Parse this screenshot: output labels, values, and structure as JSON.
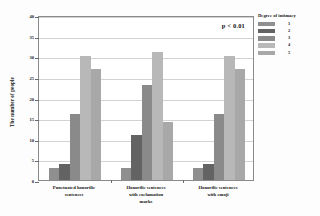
{
  "chart_data": {
    "type": "bar",
    "title": "",
    "xlabel": "",
    "ylabel": "The number of people",
    "ylim": [
      0,
      40
    ],
    "yticks": [
      0,
      5,
      10,
      15,
      20,
      25,
      30,
      35,
      40
    ],
    "ytick_labels": [
      "0",
      "5",
      "10",
      "15",
      "20",
      "25",
      "30",
      "35",
      "40"
    ],
    "grid": true,
    "legend_position": "right",
    "legend_title": "Degree of intimacy",
    "annotation": "p < 0.01",
    "categories": [
      "Punctuated honorific sentences",
      "Honorific sentences with exclamation marks",
      "Honorific sentences with emoji"
    ],
    "series": [
      {
        "name": "1",
        "color": "#8f8f8f",
        "values": [
          3,
          3,
          3
        ]
      },
      {
        "name": "2",
        "color": "#636363",
        "values": [
          4,
          11,
          4
        ]
      },
      {
        "name": "3",
        "color": "#8a8a8a",
        "values": [
          16,
          23,
          16
        ]
      },
      {
        "name": "4",
        "color": "#b8b8b8",
        "values": [
          30,
          31,
          30
        ]
      },
      {
        "name": "5",
        "color": "#a8a8a8",
        "values": [
          27,
          14,
          27
        ]
      }
    ]
  },
  "axis": {
    "ylabel": "The number of people"
  },
  "annotation": {
    "pvalue": "p < 0.01"
  },
  "legend": {
    "title": "Degree of intimacy",
    "items": [
      {
        "label": "1"
      },
      {
        "label": "2"
      },
      {
        "label": "3"
      },
      {
        "label": "4"
      },
      {
        "label": "5"
      }
    ]
  },
  "xcategories": [
    {
      "line1": "Punctuated honorific",
      "line2": "sentences",
      "line3": ""
    },
    {
      "line1": "Honorific sentences",
      "line2": "with exclamation",
      "line3": "marks"
    },
    {
      "line1": "Honorific sentences",
      "line2": "with emoji",
      "line3": ""
    }
  ]
}
